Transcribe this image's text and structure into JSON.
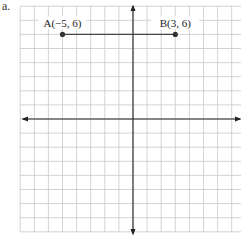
{
  "figure": {
    "part_label": "a.",
    "grid": {
      "x_min": -8,
      "x_max": 8,
      "y_min": -8,
      "y_max": 8,
      "unit_px": 14.1,
      "origin_px": [
        133,
        119
      ],
      "grid_color": "#c8c8c8",
      "axis_color": "#222222"
    },
    "points": [
      {
        "id": "A",
        "label": "A(−5, 6)",
        "x": -5,
        "y": 6
      },
      {
        "id": "B",
        "label": "B(3, 6)",
        "x": 3,
        "y": 6
      }
    ],
    "segment": {
      "from": "A",
      "to": "B",
      "color": "#444444"
    }
  }
}
